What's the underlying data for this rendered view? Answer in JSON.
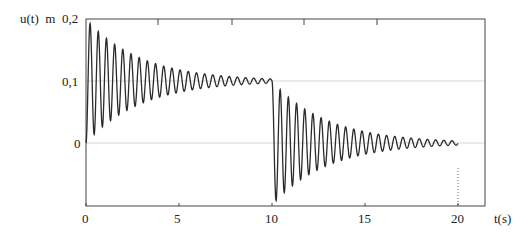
{
  "chart_data": {
    "type": "line",
    "title": "",
    "ylabel": "u(t)",
    "yunit": "m",
    "xlabel": "t(s)",
    "xlim": [
      0,
      21.5
    ],
    "ylim": [
      -0.1,
      0.2
    ],
    "x_ticks": [
      0,
      5,
      10,
      15,
      20
    ],
    "x_tick_labels": [
      "0",
      "5",
      "10",
      "15",
      "20"
    ],
    "y_ticks": [
      0,
      0.1,
      0.2
    ],
    "y_tick_labels": [
      "0",
      "0,1",
      "0,2"
    ],
    "grid": {
      "horizontal_at": [
        0,
        0.1
      ],
      "style": "light gray"
    },
    "reference_line": {
      "x": 20,
      "style": "dotted",
      "from_y": -0.1,
      "to_y": -0.04
    },
    "legend": null,
    "series": [
      {
        "name": "u(t)",
        "description": "Damped oscillatory step response: step up to 0.1 at t=0, step back down to 0 at t=10",
        "segments": [
          {
            "t_start": 0,
            "t_end": 10,
            "steady_state": 0.1,
            "initial": 0.0
          },
          {
            "t_start": 10,
            "t_end": 20,
            "steady_state": 0.0,
            "initial": 0.1
          }
        ],
        "period_s": 0.44,
        "decay_rate": 0.34,
        "sample_points": [
          {
            "t": 0.0,
            "u": 0.0
          },
          {
            "t": 0.22,
            "u": 0.193
          },
          {
            "t": 0.44,
            "u": 0.014
          },
          {
            "t": 1.1,
            "u": 0.169
          },
          {
            "t": 2.2,
            "u": 0.146
          },
          {
            "t": 3.5,
            "u": 0.13
          },
          {
            "t": 5.0,
            "u": 0.118
          },
          {
            "t": 7.5,
            "u": 0.108
          },
          {
            "t": 10.0,
            "u": 0.101
          },
          {
            "t": 10.22,
            "u": -0.093
          },
          {
            "t": 11.1,
            "u": -0.069
          },
          {
            "t": 12.2,
            "u": -0.046
          },
          {
            "t": 13.5,
            "u": -0.03
          },
          {
            "t": 15.0,
            "u": -0.018
          },
          {
            "t": 17.5,
            "u": -0.008
          },
          {
            "t": 20.0,
            "u": -0.001
          }
        ]
      }
    ]
  },
  "axes": {
    "y_label": "u(t)",
    "y_unit": "m",
    "x_label": "t(s)",
    "y_tick_02": "0,2",
    "y_tick_01": "0,1",
    "y_tick_0": "0",
    "x_tick_0": "0",
    "x_tick_5": "5",
    "x_tick_10": "10",
    "x_tick_15": "15",
    "x_tick_20": "20"
  },
  "colors": {
    "curve": "#2a2a2a",
    "axis": "#444444",
    "grid": "#d8d8d8"
  }
}
